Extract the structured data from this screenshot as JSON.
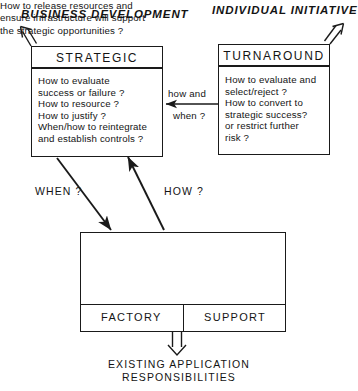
{
  "diagram": {
    "headers": {
      "left": "BUSINESS DEVELOPMENT",
      "right": "INDIVIDUAL INITIATIVE"
    },
    "boxes": {
      "strategic": {
        "title": "STRATEGIC",
        "body": "How to evaluate\nsuccess or failure ?\nHow to resource ?\nHow to justify ?\nWhen/how to reintegrate\nand establish controls ?"
      },
      "turnaround": {
        "title": "TURNAROUND",
        "body": "How to evaluate and\nselect/reject ?\nHow to convert to\nstrategic success?\nor restrict further\nrisk ?"
      },
      "bottom": {
        "body": "How to release resources and\nensure infrastructure will support\nthe strategic opportunities ?",
        "cells": [
          {
            "label": "FACTORY"
          },
          {
            "label": "SUPPORT"
          }
        ]
      }
    },
    "connector_labels": {
      "how_and": "how and",
      "when_q": "when ?",
      "when": "WHEN ?",
      "how": "HOW ?"
    },
    "caption": "EXISTING APPLICATION\nRESPONSIBILITIES",
    "colors": {
      "stroke": "#1a1a1a",
      "text": "#141414",
      "background": "#ffffff"
    }
  }
}
